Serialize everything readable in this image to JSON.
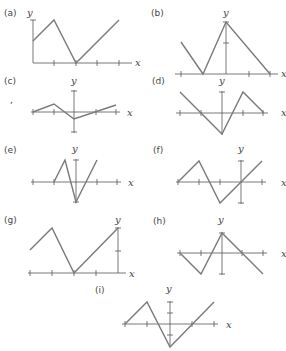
{
  "panels": [
    {
      "label": "(a)",
      "ylabel": "y",
      "xlabel": "x",
      "axis": {
        "ox": 33,
        "oy": 63,
        "xmin": 33,
        "xmax": 132,
        "ymin": 20,
        "ymax": 63
      },
      "xticks": [
        54,
        76,
        97,
        119
      ],
      "yticks": [
        20
      ],
      "points": [
        [
          33,
          41
        ],
        [
          54,
          20
        ],
        [
          76,
          63
        ],
        [
          119,
          20
        ]
      ],
      "labelPos": {
        "tag": [
          4,
          16
        ],
        "y": [
          27,
          16
        ],
        "x": [
          135,
          66
        ]
      }
    },
    {
      "label": "(b)",
      "ylabel": "y",
      "xlabel": "x",
      "axis": {
        "ox": 226,
        "oy": 74,
        "xmin": 175,
        "xmax": 278,
        "ymin": 22,
        "ymax": 74
      },
      "xticks": [
        181,
        249,
        270
      ],
      "yticks": [
        43,
        22
      ],
      "points": [
        [
          181,
          42
        ],
        [
          203,
          74
        ],
        [
          226,
          22
        ],
        [
          270,
          74
        ]
      ],
      "labelPos": {
        "tag": [
          151,
          16
        ],
        "y": [
          223,
          16
        ],
        "x": [
          281,
          77
        ]
      }
    },
    {
      "label": "(c)",
      "ylabel": "y",
      "xlabel": "x",
      "axis": {
        "ox": 74,
        "oy": 112,
        "xmin": 31,
        "xmax": 120,
        "ymin": 90,
        "ymax": 133
      },
      "xticks": [
        33,
        54,
        96,
        116
      ],
      "yticks": [
        91,
        132
      ],
      "points": [
        [
          33,
          112
        ],
        [
          54,
          104
        ],
        [
          74,
          119
        ],
        [
          116,
          105
        ]
      ],
      "labelPos": {
        "tag": [
          4,
          84
        ],
        "y": [
          71,
          84
        ],
        "x": [
          127,
          116
        ]
      }
    },
    {
      "label": "(d)",
      "ylabel": "y",
      "xlabel": "x",
      "axis": {
        "ox": 222,
        "oy": 113,
        "xmin": 176,
        "xmax": 268,
        "ymin": 91,
        "ymax": 135
      },
      "xticks": [
        180,
        201,
        243,
        263
      ],
      "yticks": [
        92
      ],
      "points": [
        [
          180,
          92
        ],
        [
          222,
          134
        ],
        [
          243,
          92
        ],
        [
          264,
          113
        ]
      ],
      "labelPos": {
        "tag": [
          152,
          84
        ],
        "y": [
          219,
          84
        ],
        "x": [
          281,
          116
        ]
      }
    },
    {
      "label": "(e)",
      "ylabel": "y",
      "xlabel": "x",
      "axis": {
        "ox": 76,
        "oy": 182,
        "xmin": 31,
        "xmax": 121,
        "ymin": 159,
        "ymax": 203
      },
      "xticks": [
        33,
        54,
        97,
        117
      ],
      "yticks": [
        160,
        202
      ],
      "points": [
        [
          54,
          182
        ],
        [
          65,
          160
        ],
        [
          76,
          202
        ],
        [
          97,
          160
        ]
      ],
      "labelPos": {
        "tag": [
          4,
          153
        ],
        "y": [
          72,
          152
        ],
        "x": [
          128,
          186
        ]
      }
    },
    {
      "label": "(f)",
      "ylabel": "y",
      "xlabel": "x",
      "axis": {
        "ox": 241,
        "oy": 182,
        "xmin": 176,
        "xmax": 266,
        "ymin": 160,
        "ymax": 204
      },
      "xticks": [
        178,
        199,
        220,
        262
      ],
      "yticks": [
        161,
        203
      ],
      "points": [
        [
          178,
          182
        ],
        [
          199,
          161
        ],
        [
          220,
          203
        ],
        [
          262,
          161
        ]
      ],
      "labelPos": {
        "tag": [
          153,
          153
        ],
        "y": [
          238,
          152
        ],
        "x": [
          281,
          186
        ]
      }
    },
    {
      "label": "(g)",
      "ylabel": "y",
      "xlabel": "x",
      "axis": {
        "ox": 118,
        "oy": 273,
        "xmin": 28,
        "xmax": 126,
        "ymin": 227,
        "ymax": 273
      },
      "xticks": [
        30,
        52,
        74,
        96
      ],
      "yticks": [
        251,
        228
      ],
      "points": [
        [
          30,
          250
        ],
        [
          52,
          228
        ],
        [
          74,
          273
        ],
        [
          118,
          228
        ]
      ],
      "labelPos": {
        "tag": [
          4,
          223
        ],
        "y": [
          115,
          223
        ],
        "x": [
          129,
          277
        ]
      }
    },
    {
      "label": "(h)",
      "ylabel": "y",
      "xlabel": "x",
      "axis": {
        "ox": 222,
        "oy": 253,
        "xmin": 177,
        "xmax": 267,
        "ymin": 232,
        "ymax": 275
      },
      "xticks": [
        180,
        201,
        242,
        263
      ],
      "yticks": [
        233,
        274
      ],
      "points": [
        [
          180,
          253
        ],
        [
          201,
          274
        ],
        [
          222,
          233
        ],
        [
          263,
          274
        ]
      ],
      "labelPos": {
        "tag": [
          153,
          224
        ],
        "y": [
          218,
          223
        ],
        "x": [
          281,
          257
        ]
      }
    },
    {
      "label": "(i)",
      "ylabel": "y",
      "xlabel": "x",
      "axis": {
        "ox": 170,
        "oy": 324,
        "xmin": 122,
        "xmax": 218,
        "ymin": 301,
        "ymax": 347
      },
      "xticks": [
        125,
        147,
        192,
        214
      ],
      "yticks": [
        302,
        313,
        335
      ],
      "points": [
        [
          125,
          324
        ],
        [
          147,
          302
        ],
        [
          170,
          347
        ],
        [
          214,
          302
        ]
      ],
      "labelPos": {
        "tag": [
          95,
          293
        ],
        "y": [
          166,
          292
        ],
        "x": [
          226,
          328
        ]
      }
    }
  ],
  "stray_mark": {
    "x": 10,
    "y": 103,
    "text": ","
  }
}
